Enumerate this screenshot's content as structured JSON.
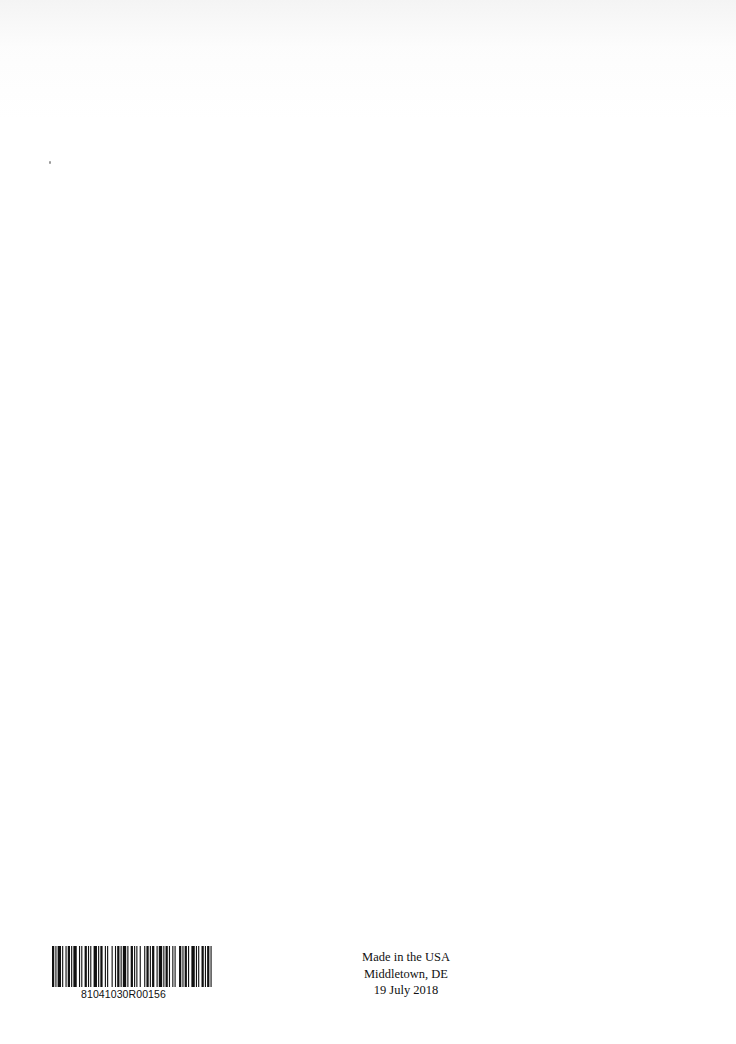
{
  "page": {
    "background": "#ffffff",
    "ink_color": "#111111"
  },
  "barcode": {
    "number": "81041030R00156",
    "bars": [
      2,
      1,
      1,
      1,
      3,
      1,
      1,
      2,
      1,
      1,
      2,
      1,
      1,
      1,
      3,
      2,
      1,
      1,
      1,
      2,
      2,
      1,
      1,
      1,
      1,
      2,
      3,
      1,
      1,
      1,
      2,
      2,
      1,
      1,
      1,
      3,
      1,
      2,
      1,
      1,
      2,
      1,
      1,
      1,
      3,
      1,
      1,
      2,
      2,
      1,
      1,
      1,
      1,
      2,
      1,
      3,
      1,
      1,
      2,
      1,
      1,
      1,
      2,
      2,
      1,
      1,
      3,
      1,
      1,
      1,
      2,
      1,
      1,
      2,
      1,
      1,
      1,
      3,
      2,
      1,
      1,
      1,
      2,
      1,
      1,
      2,
      3,
      1,
      1,
      1,
      1,
      2,
      2,
      1,
      1,
      1,
      2,
      1,
      1,
      3
    ]
  },
  "imprint": {
    "line1": "Made in the USA",
    "line2": "Middletown, DE",
    "line3": "19 July 2018"
  }
}
